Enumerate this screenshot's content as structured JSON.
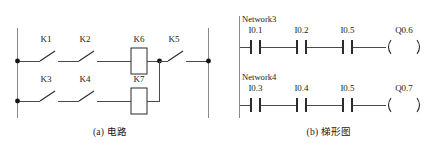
{
  "figure": {
    "panels": [
      {
        "id": "circuit",
        "caption": "(a) 电路",
        "type": "relay-circuit"
      },
      {
        "id": "ladder",
        "caption": "(b) 梯形图",
        "type": "plc-ladder-diagram"
      }
    ]
  },
  "circuit": {
    "branches": [
      {
        "id": "upper",
        "switches": [
          {
            "label": "K1"
          },
          {
            "label": "K2"
          }
        ],
        "coil": {
          "label": "K6"
        }
      },
      {
        "id": "lower",
        "switches": [
          {
            "label": "K3"
          },
          {
            "label": "K4"
          }
        ],
        "coil": {
          "label": "K7"
        }
      }
    ],
    "series_switch": {
      "label": "K5"
    }
  },
  "ladder": {
    "networks": [
      {
        "name": "Network3",
        "contacts": [
          {
            "label": "I0.1",
            "kind": "normally-open"
          },
          {
            "label": "I0.2",
            "kind": "normally-open"
          },
          {
            "label": "I0.5",
            "kind": "normally-open"
          }
        ],
        "coil": {
          "label": "Q0.6",
          "kind": "output-coil"
        }
      },
      {
        "name": "Network4",
        "contacts": [
          {
            "label": "I0.3",
            "kind": "normally-open"
          },
          {
            "label": "I0.4",
            "kind": "normally-open"
          },
          {
            "label": "I0.5",
            "kind": "normally-open"
          }
        ],
        "coil": {
          "label": "Q0.7",
          "kind": "output-coil"
        }
      }
    ]
  },
  "colors": {
    "background": "#ffffff",
    "ink": "#1a1a1a",
    "wire": "#4a4a4a",
    "rail": "#8a8a8a",
    "symbol": "#2b2b2b"
  }
}
